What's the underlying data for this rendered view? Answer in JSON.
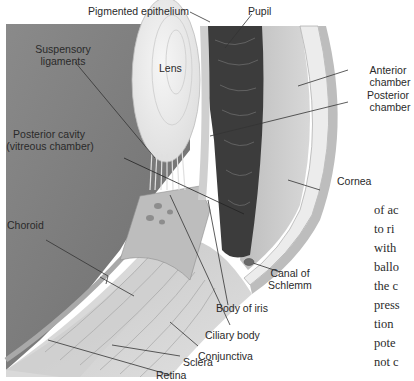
{
  "figure": {
    "labels": {
      "pigmented_epithelium": "Pigmented epithelium",
      "pupil": "Pupil",
      "suspensory_ligaments_1": "Suspensory",
      "suspensory_ligaments_2": "ligaments",
      "lens": "Lens",
      "anterior_chamber_1": "Anterior",
      "anterior_chamber_2": "chamber",
      "posterior_chamber_1": "Posterior",
      "posterior_chamber_2": "chamber",
      "posterior_cavity_1": "Posterior cavity",
      "posterior_cavity_2": "(vitreous chamber)",
      "cornea": "Cornea",
      "choroid": "Choroid",
      "canal_of_schlemm_1": "Canal of",
      "canal_of_schlemm_2": "Schlemm",
      "body_of_iris": "Body of iris",
      "ciliary_body": "Ciliary body",
      "conjunctiva": "Conjunctiva",
      "sclera": "Sclera",
      "retina": "Retina"
    },
    "colors": {
      "vitreous": "#7d7d7d",
      "lens": "#ececec",
      "iris": "#3e3e3e",
      "anterior_chamber": "#c9c9c9",
      "cornea": "#e6e6e6",
      "sclera": "#d2d2d2",
      "ciliary": "#bcbcbc",
      "background": "#ffffff"
    }
  },
  "page_text": {
    "lines": [
      "of ac",
      "to ri",
      "with",
      "ballo",
      "the c",
      "press",
      "tion",
      "pote",
      "not c"
    ],
    "heading": "The",
    "lines2": [
      "The l",
      "sory",
      "(Figu"
    ]
  }
}
